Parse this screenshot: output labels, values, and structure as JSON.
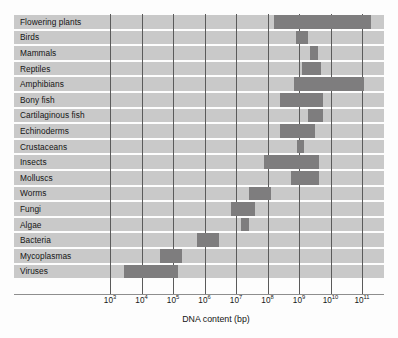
{
  "figure": {
    "axis_title": "DNA content (bp)",
    "bar_color": "#7e7d7e",
    "row_color": "#c9c9c9",
    "gridline_color": "#5b5b5b",
    "background": "#fdfdfd"
  },
  "chart_data": {
    "type": "bar",
    "orientation": "horizontal",
    "title": "",
    "xlabel": "DNA content (bp)",
    "ylabel": "",
    "xscale": "log",
    "xlim": [
      1000,
      100000000000
    ],
    "xlim_exponents": [
      3,
      11
    ],
    "grid": true,
    "legend": "none",
    "tick_labels": [
      "10^3",
      "10^4",
      "10^5",
      "10^6",
      "10^7",
      "10^8",
      "10^9",
      "10^10",
      "10^11"
    ],
    "tick_exponents": [
      3,
      4,
      5,
      6,
      7,
      8,
      9,
      10,
      11
    ],
    "value_unit": "base pairs",
    "note": "Each bar is a range of genome sizes; values given as log10 start and end.",
    "categories": [
      "Flowering plants",
      "Birds",
      "Mammals",
      "Reptiles",
      "Amphibians",
      "Bony fish",
      "Cartilaginous fish",
      "Echinoderms",
      "Crustaceans",
      "Insects",
      "Molluscs",
      "Worms",
      "Fungi",
      "Algae",
      "Bacteria",
      "Mycoplasmas",
      "Viruses"
    ],
    "ranges_log10": [
      [
        8.2,
        11.3
      ],
      [
        8.9,
        9.3
      ],
      [
        9.35,
        9.6
      ],
      [
        9.1,
        9.7
      ],
      [
        8.85,
        11.05
      ],
      [
        8.4,
        9.75
      ],
      [
        9.3,
        9.75
      ],
      [
        8.4,
        9.5
      ],
      [
        8.95,
        9.15
      ],
      [
        7.9,
        9.65
      ],
      [
        8.75,
        9.65
      ],
      [
        7.4,
        8.1
      ],
      [
        6.85,
        7.6
      ],
      [
        7.15,
        7.4
      ],
      [
        5.75,
        6.45
      ],
      [
        4.6,
        5.3
      ],
      [
        3.45,
        5.15
      ]
    ],
    "ranges_bp": [
      [
        "1.6e8",
        "2.0e11"
      ],
      [
        "7.9e8",
        "2.0e9"
      ],
      [
        "2.2e9",
        "4.0e9"
      ],
      [
        "1.3e9",
        "5.0e9"
      ],
      [
        "7.1e8",
        "1.1e11"
      ],
      [
        "2.5e8",
        "5.6e9"
      ],
      [
        "2.0e9",
        "5.6e9"
      ],
      [
        "2.5e8",
        "3.2e9"
      ],
      [
        "8.9e8",
        "1.4e9"
      ],
      [
        "7.9e7",
        "4.5e9"
      ],
      [
        "5.6e8",
        "4.5e9"
      ],
      [
        "2.5e7",
        "1.3e8"
      ],
      [
        "7.1e6",
        "4.0e7"
      ],
      [
        "1.4e7",
        "2.5e7"
      ],
      [
        "5.6e5",
        "2.8e6"
      ],
      [
        "4.0e4",
        "2.0e5"
      ],
      [
        "2.8e3",
        "1.4e5"
      ]
    ]
  }
}
